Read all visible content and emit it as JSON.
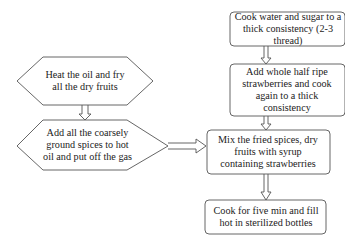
{
  "diagram": {
    "left_column": {
      "step1": "Heat the oil and fry all the dry fruits",
      "step2": "Add all the coarsely ground spices to hot oil and put off the gas"
    },
    "right_column": {
      "step1": "Cook water and sugar to a thick consistency (2-3 thread)",
      "step2": "Add whole half ripe strawberries and cook again to a thick consistency",
      "step3": "Mix the fried spices, dry fruits with syrup containing strawberries",
      "step4": "Cook for five min and fill hot in sterilized bottles"
    },
    "colors": {
      "stroke": "#555555",
      "background": "#ffffff",
      "text": "#222222"
    }
  }
}
